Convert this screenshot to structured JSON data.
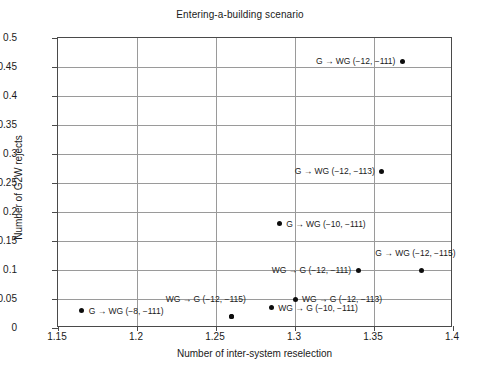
{
  "chart_data": {
    "type": "scatter",
    "title": "Entering-a-building scenario",
    "xlabel": "Number of inter-system reselection",
    "ylabel": "Number of G2W rejects",
    "xlim": [
      1.15,
      1.4
    ],
    "ylim": [
      0,
      0.5
    ],
    "grid": true,
    "legend": "none",
    "xticks": [
      "1.15",
      "1.2",
      "1.25",
      "1.3",
      "1.35",
      "1.4"
    ],
    "xtick_values": [
      1.15,
      1.2,
      1.25,
      1.3,
      1.35,
      1.4
    ],
    "yticks": [
      "0",
      "0.05",
      "0.1",
      "0.15",
      "0.2",
      "0.25",
      "0.3",
      "0.35",
      "0.4",
      "0.45",
      "0.5"
    ],
    "ytick_values": [
      0,
      0.05,
      0.1,
      0.15,
      0.2,
      0.25,
      0.3,
      0.35,
      0.4,
      0.45,
      0.5
    ],
    "points": [
      {
        "label": "G → WG (−12, −111)",
        "x": 1.368,
        "y": 0.46,
        "label_side": "left"
      },
      {
        "label": "G → WG (−12, −113)",
        "x": 1.355,
        "y": 0.27,
        "label_side": "left"
      },
      {
        "label": "G → WG (−10, −111)",
        "x": 1.29,
        "y": 0.18,
        "label_side": "right"
      },
      {
        "label": "G → WG (−12, −115)",
        "x": 1.38,
        "y": 0.1,
        "label_side": "above"
      },
      {
        "label": "WG → G (−12, −111)",
        "x": 1.34,
        "y": 0.1,
        "label_side": "left"
      },
      {
        "label": "WG → G (−12, −113)",
        "x": 1.3,
        "y": 0.05,
        "label_side": "right"
      },
      {
        "label": "WG → G (−10, −111)",
        "x": 1.285,
        "y": 0.035,
        "label_side": "right"
      },
      {
        "label": "WG → G (−12, −115)",
        "x": 1.26,
        "y": 0.02,
        "label_side": "above-left"
      },
      {
        "label": "WG → G (−8, −111)",
        "x": 1.26,
        "y": 0.02,
        "label_side": "none"
      },
      {
        "label": "G → WG (−8, −111)",
        "x": 1.165,
        "y": 0.03,
        "label_side": "right"
      }
    ]
  },
  "style": {
    "point_color": "#0d0d0d",
    "grid_color": "#9a9a9a",
    "frame_color": "#4a4a4a",
    "text_color": "#1a1a1a",
    "background": "#ffffff"
  }
}
